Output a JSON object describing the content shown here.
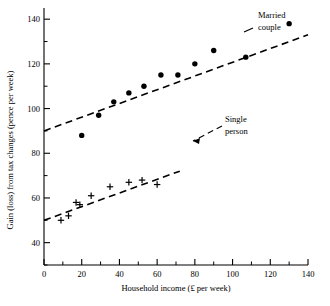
{
  "chart_data": {
    "type": "scatter",
    "title": "",
    "xlabel": "Household income (£ per week)",
    "ylabel": "Gain (loss) from tax changes (pence per week)",
    "xlim": [
      0,
      140
    ],
    "ylim": [
      30,
      145
    ],
    "x_ticks_major": [
      0,
      20,
      40,
      60,
      80,
      100,
      120,
      140
    ],
    "x_ticks_minor": [
      10,
      30,
      50,
      70,
      90,
      110,
      130
    ],
    "x_tick_labels": [
      "0",
      "20",
      "40",
      "60",
      "80",
      "100",
      "120",
      "140"
    ],
    "y_ticks_major": [
      40,
      60,
      80,
      100,
      120,
      140
    ],
    "y_ticks_minor": [
      30,
      50,
      70,
      90,
      110,
      130
    ],
    "y_tick_labels": [
      "40",
      "60",
      "80",
      "100",
      "120",
      "140"
    ],
    "grid": false,
    "legend_position": "inline-annotation",
    "series": [
      {
        "name": "Married couple",
        "marker": "filled-circle",
        "annotation": "Married\ncouple",
        "annotation_line1": "Married",
        "annotation_line2": "couple",
        "points": [
          {
            "x": 20,
            "y": 88
          },
          {
            "x": 29,
            "y": 97
          },
          {
            "x": 37,
            "y": 103
          },
          {
            "x": 45,
            "y": 107
          },
          {
            "x": 53,
            "y": 110
          },
          {
            "x": 62,
            "y": 115
          },
          {
            "x": 71,
            "y": 115
          },
          {
            "x": 80,
            "y": 120
          },
          {
            "x": 90,
            "y": 126
          },
          {
            "x": 107,
            "y": 123
          },
          {
            "x": 130,
            "y": 138
          }
        ],
        "fit_line": {
          "x1": 0,
          "y1": 90,
          "x2": 140,
          "y2": 133
        }
      },
      {
        "name": "Single person",
        "marker": "plus",
        "annotation": "Single\nperson",
        "annotation_line1": "Single",
        "annotation_line2": "person",
        "points": [
          {
            "x": 9,
            "y": 50
          },
          {
            "x": 13,
            "y": 52
          },
          {
            "x": 17,
            "y": 58
          },
          {
            "x": 19,
            "y": 57
          },
          {
            "x": 25,
            "y": 61
          },
          {
            "x": 35,
            "y": 65
          },
          {
            "x": 45,
            "y": 67
          },
          {
            "x": 52,
            "y": 68
          },
          {
            "x": 60,
            "y": 66
          }
        ],
        "fit_line": {
          "x1": 0,
          "y1": 50,
          "x2": 72,
          "y2": 72
        }
      }
    ]
  }
}
